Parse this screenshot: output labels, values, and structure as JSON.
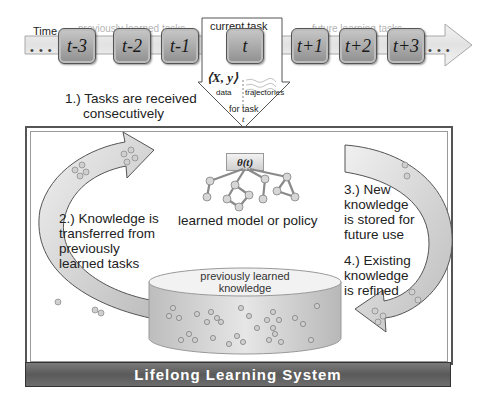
{
  "timeline": {
    "time_label": "Time",
    "previous_label": "previously learned tasks",
    "current_label": "current task",
    "future_label": "future learning tasks",
    "leading_dots": "• • •",
    "trailing_dots": "• • •",
    "tasks": [
      {
        "label": "t-3",
        "left": 58
      },
      {
        "label": "t-2",
        "left": 113
      },
      {
        "label": "t-1",
        "left": 161
      },
      {
        "label": "t",
        "left": 226
      },
      {
        "label": "t+1",
        "left": 291
      },
      {
        "label": "t+2",
        "left": 339
      },
      {
        "label": "t+3",
        "left": 387
      }
    ]
  },
  "current_input": {
    "data_symbol": "⟨X, y⟩",
    "data_label": "data",
    "trajectories_label": "trajectories",
    "for_task_label": "for task",
    "task_var": "t"
  },
  "steps": {
    "step1": [
      "1.) Tasks are received",
      "consecutively"
    ],
    "step2": [
      "2.) Knowledge is",
      "transferred from",
      "previously",
      "learned tasks"
    ],
    "step3": [
      "3.) New",
      "knowledge",
      "is stored for",
      "future use"
    ],
    "step4": [
      "4.) Existing",
      "knowledge",
      "is refined"
    ]
  },
  "model": {
    "theta_label": "θ(t)",
    "caption": "learned model or policy"
  },
  "knowledge_base": {
    "label_line1": "previously learned",
    "label_line2": "knowledge"
  },
  "system": {
    "title": "Lifelong Learning System"
  },
  "colors": {
    "task_fill": "#9c9c9c",
    "arrow_fill": "#d9d9d9",
    "footer_fill": "#666666",
    "muted_text": "#b5b5b5"
  }
}
